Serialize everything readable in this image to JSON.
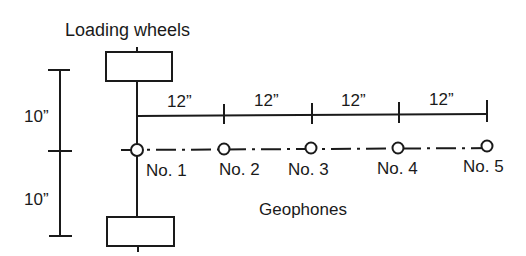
{
  "title": "Loading wheels",
  "geophones_label": "Geophones",
  "vertical_dims": [
    {
      "label": "10”",
      "x": 24,
      "y": 122
    },
    {
      "label": "10”",
      "x": 24,
      "y": 205
    }
  ],
  "horizontal_dims": [
    {
      "label": "12”",
      "x": 181
    },
    {
      "label": "12”",
      "x": 268
    },
    {
      "label": "12”",
      "x": 355
    },
    {
      "label": "12”",
      "x": 443
    }
  ],
  "geophones": [
    {
      "label": "No. 1",
      "x": 137,
      "lx": 146
    },
    {
      "label": "No. 2",
      "x": 224,
      "lx": 219
    },
    {
      "label": "No. 3",
      "x": 311,
      "lx": 287
    },
    {
      "label": "No. 4",
      "x": 398,
      "lx": 377
    },
    {
      "label": "No. 5",
      "x": 487,
      "lx": 463
    }
  ],
  "colors": {
    "line": "#1a1a1a",
    "background": "#ffffff"
  }
}
